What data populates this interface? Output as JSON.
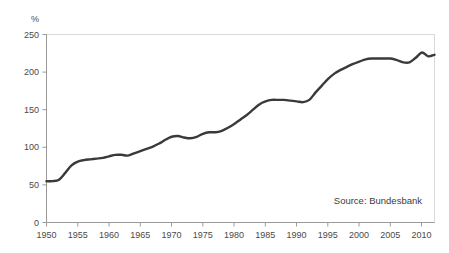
{
  "chart_data": {
    "type": "line",
    "title": "",
    "subtitle": "",
    "xlabel": "",
    "ylabel": "%",
    "unit_label": "%",
    "xlim": [
      1950,
      2012
    ],
    "ylim": [
      0,
      250
    ],
    "grid": false,
    "legend": null,
    "legend_position": "none",
    "annotations": [
      {
        "name": "source-note",
        "text": "Source: Bundesbank",
        "x": 2004,
        "y": 30
      }
    ],
    "y_ticks": [
      0,
      50,
      100,
      150,
      200,
      250
    ],
    "y_tick_labels": [
      "0",
      "50",
      "100",
      "150",
      "200",
      "250"
    ],
    "x_ticks": [
      1950,
      1955,
      1960,
      1965,
      1970,
      1975,
      1980,
      1985,
      1990,
      1995,
      2000,
      2005,
      2010
    ],
    "x_tick_labels": [
      "1950",
      "1955",
      "1960",
      "1965",
      "1970",
      "1975",
      "1980",
      "1985",
      "1990",
      "1995",
      "2000",
      "2005",
      "2010"
    ],
    "series": [
      {
        "name": "ratio",
        "color": "#3a3a3a",
        "x": [
          1950,
          1951,
          1952,
          1953,
          1954,
          1955,
          1956,
          1957,
          1958,
          1959,
          1960,
          1961,
          1962,
          1963,
          1964,
          1965,
          1966,
          1967,
          1968,
          1969,
          1970,
          1971,
          1972,
          1973,
          1974,
          1975,
          1976,
          1977,
          1978,
          1979,
          1980,
          1981,
          1982,
          1983,
          1984,
          1985,
          1986,
          1987,
          1988,
          1989,
          1990,
          1991,
          1992,
          1993,
          1994,
          1995,
          1996,
          1997,
          1998,
          1999,
          2000,
          2001,
          2002,
          2003,
          2004,
          2005,
          2006,
          2007,
          2008,
          2009,
          2010,
          2011,
          2012
        ],
        "y": [
          55,
          55,
          57,
          66,
          76,
          81,
          83,
          84,
          85,
          86,
          88,
          90,
          90,
          89,
          92,
          95,
          98,
          101,
          105,
          110,
          114,
          115,
          113,
          112,
          114,
          118,
          120,
          120,
          122,
          126,
          131,
          137,
          143,
          150,
          157,
          161,
          163,
          163,
          163,
          162,
          161,
          160,
          163,
          173,
          182,
          191,
          198,
          203,
          207,
          211,
          214,
          217,
          218,
          218,
          218,
          218,
          216,
          213,
          213,
          219,
          226,
          221,
          223
        ]
      }
    ]
  },
  "chart_meta": {
    "background_color": "#ffffff",
    "line_color": "#3a3a3a",
    "axis_color": "#9a9a9a",
    "frame_color": "#d9d9d9",
    "text_color": "#4a4a4a"
  }
}
